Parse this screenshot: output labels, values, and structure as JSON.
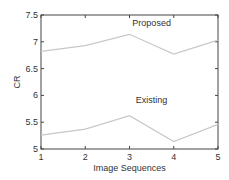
{
  "chart_data": {
    "type": "line",
    "title": "",
    "xlabel": "Image Sequences",
    "ylabel": "CR",
    "x": [
      1,
      2,
      3,
      4,
      5
    ],
    "xticks": [
      "1",
      "2",
      "3",
      "4",
      "5"
    ],
    "yticks": [
      "5",
      "5.5",
      "6",
      "6.5",
      "7",
      "7.5"
    ],
    "xlim": [
      1,
      5
    ],
    "ylim": [
      5,
      7.5
    ],
    "grid": false,
    "series": [
      {
        "name": "Proposed",
        "values": [
          6.82,
          6.93,
          7.14,
          6.77,
          7.03
        ],
        "color": "#c8c8c8"
      },
      {
        "name": "Existing",
        "values": [
          5.26,
          5.37,
          5.62,
          5.14,
          5.46
        ],
        "color": "#c8c8c8"
      }
    ],
    "annotations": [
      {
        "text": "Proposed",
        "x": 3.5,
        "y": 7.3
      },
      {
        "text": "Existing",
        "x": 3.5,
        "y": 5.85
      }
    ]
  }
}
